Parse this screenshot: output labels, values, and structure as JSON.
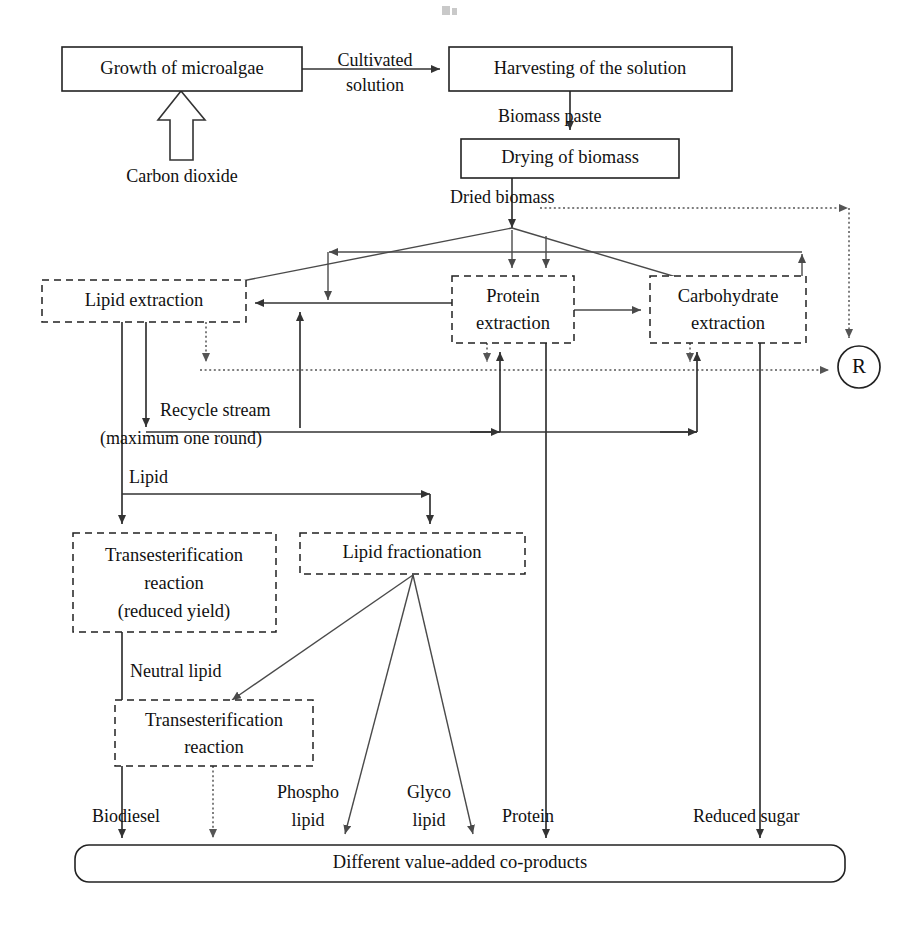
{
  "diagram": {
    "colors": {
      "background": "#ffffff",
      "stroke": "#333333",
      "dotted_stroke": "#555555",
      "text": "#111111"
    },
    "nodes": [
      {
        "id": "growth",
        "label": "Growth of microalgae",
        "style": "solid",
        "x": 62,
        "y": 47,
        "w": 240,
        "h": 44
      },
      {
        "id": "harvesting",
        "label": "Harvesting of the solution",
        "style": "solid",
        "x": 449,
        "y": 47,
        "w": 283,
        "h": 44
      },
      {
        "id": "drying",
        "label": "Drying of biomass",
        "style": "solid",
        "x": 461,
        "y": 139,
        "w": 218,
        "h": 39
      },
      {
        "id": "lipid-extraction",
        "label": "Lipid extraction",
        "style": "dashed",
        "x": 42,
        "y": 280,
        "w": 204,
        "h": 42
      },
      {
        "id": "protein-extraction",
        "label_line1": "Protein",
        "label_line2": "extraction",
        "style": "dashed",
        "x": 452,
        "y": 276,
        "w": 122,
        "h": 67
      },
      {
        "id": "carb-extraction",
        "label_line1": "Carbohydrate",
        "label_line2": "extraction",
        "style": "dashed",
        "x": 650,
        "y": 276,
        "w": 156,
        "h": 67
      },
      {
        "id": "transest-reduced",
        "label_line1": "Transesterification",
        "label_line2": "reaction",
        "label_line3": "(reduced yield)",
        "style": "dashed",
        "x": 73,
        "y": 533,
        "w": 203,
        "h": 99
      },
      {
        "id": "lipid-fractionation",
        "label": "Lipid fractionation",
        "style": "dashed",
        "x": 300,
        "y": 533,
        "w": 225,
        "h": 41
      },
      {
        "id": "transest-2",
        "label_line1": "Transesterification",
        "label_line2": "reaction",
        "style": "dashed",
        "x": 115,
        "y": 700,
        "w": 198,
        "h": 66
      },
      {
        "id": "coproducts",
        "label": "Different value-added co-products",
        "style": "rounded",
        "x": 75,
        "y": 845,
        "w": 770,
        "h": 37
      }
    ],
    "recycle_node": {
      "id": "R",
      "label": "R",
      "cx": 859,
      "cy": 367,
      "r": 21
    },
    "edge_labels": [
      {
        "id": "cultivated-solution",
        "line1": "Cultivated",
        "line2": "solution",
        "x": 375,
        "y": 50
      },
      {
        "id": "carbon-dioxide",
        "text": "Carbon dioxide",
        "x": 164,
        "y": 178
      },
      {
        "id": "biomass-paste",
        "text": "Biomass paste",
        "x": 498,
        "y": 118
      },
      {
        "id": "dried-biomass",
        "text": "Dried biomass",
        "x": 450,
        "y": 199
      },
      {
        "id": "recycle-stream",
        "line1": "Recycle stream",
        "line2": "(maximum one round)",
        "x": 158,
        "y": 409
      },
      {
        "id": "lipid",
        "text": "Lipid",
        "x": 123,
        "y": 479
      },
      {
        "id": "neutral-lipid",
        "text": "Neutral lipid",
        "x": 128,
        "y": 673
      },
      {
        "id": "biodiesel",
        "text": "Biodiesel",
        "x": 92,
        "y": 818
      },
      {
        "id": "phospho-lipid",
        "line1": "Phospho",
        "line2": "lipid",
        "x": 270,
        "y": 795
      },
      {
        "id": "glyco-lipid",
        "line1": "Glyco",
        "line2": "lipid",
        "x": 403,
        "y": 795
      },
      {
        "id": "protein-out",
        "text": "Protein",
        "x": 502,
        "y": 818
      },
      {
        "id": "reduced-sugar",
        "text": "Reduced sugar",
        "x": 693,
        "y": 818
      }
    ]
  }
}
